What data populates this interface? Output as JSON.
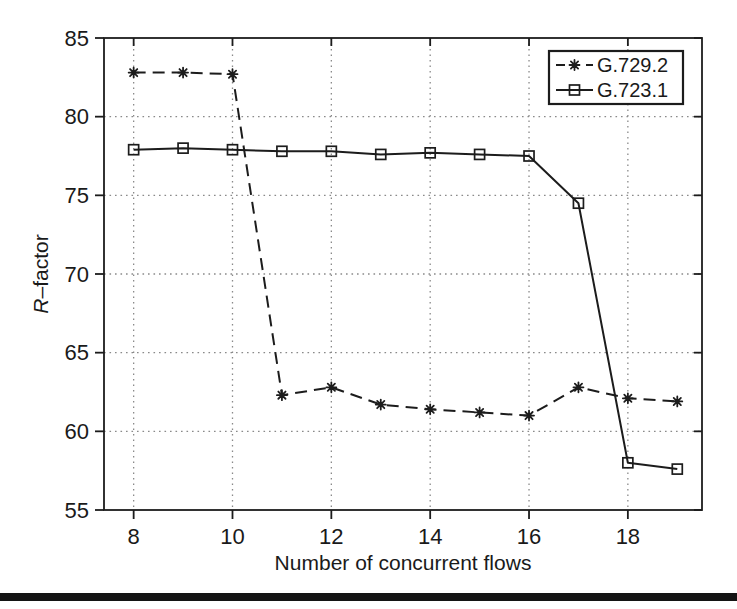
{
  "figure": {
    "divider_color": "#141414",
    "background": "#ffffff"
  },
  "chart_data": {
    "type": "line",
    "title": "",
    "xlabel": "Number of concurrent flows",
    "ylabel": "R-factor",
    "ylabel_parts": {
      "italic": "R",
      "rest": "–factor"
    },
    "xlim": [
      7.4,
      19.5
    ],
    "ylim": [
      55,
      85
    ],
    "xticks": [
      8,
      10,
      12,
      14,
      16,
      18
    ],
    "yticks": [
      55,
      60,
      65,
      70,
      75,
      80,
      85
    ],
    "grid_xticks": [
      8,
      10,
      12,
      14,
      16,
      18
    ],
    "grid_yticks": [
      60,
      65,
      70,
      75,
      80
    ],
    "grid_style": "dotted",
    "legend_position": "top-right",
    "x": [
      8,
      9,
      10,
      11,
      12,
      13,
      14,
      15,
      16,
      17,
      18,
      19
    ],
    "series": [
      {
        "name": "G.729.2",
        "line": "dashed",
        "marker": "asterisk",
        "color": "#1c1c1c",
        "values": [
          82.8,
          82.8,
          82.7,
          62.3,
          62.8,
          61.7,
          61.4,
          61.2,
          61.0,
          62.8,
          62.1,
          61.9
        ]
      },
      {
        "name": "G.723.1",
        "line": "solid",
        "marker": "square",
        "color": "#1c1c1c",
        "values": [
          77.9,
          78.0,
          77.9,
          77.8,
          77.8,
          77.6,
          77.7,
          77.6,
          77.5,
          74.5,
          58.0,
          57.6
        ]
      }
    ],
    "colors": {
      "axis": "#1c1c1c",
      "grid": "#8a8a8a",
      "text": "#1a1a1a",
      "legend_bg": "#ffffff"
    }
  }
}
